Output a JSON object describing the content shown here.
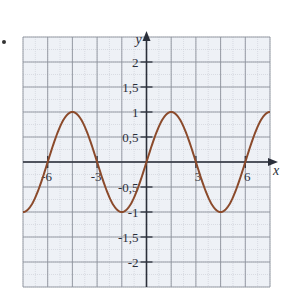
{
  "chart_data": {
    "type": "line",
    "title": "",
    "xlabel": "x",
    "ylabel": "y",
    "xlim": [
      -7.5,
      7.5
    ],
    "ylim": [
      -2.5,
      2.5
    ],
    "grid": true,
    "x_ticks": [
      -6,
      -3,
      3,
      6
    ],
    "x_tick_labels": [
      "-6",
      "-3",
      "3",
      "6"
    ],
    "y_ticks": [
      2,
      1.5,
      1,
      0.5,
      -0.5,
      -1,
      -1.5,
      -2
    ],
    "y_tick_labels": [
      "2",
      "1,5",
      "1",
      "0,5",
      "-0,5",
      "-1",
      "-1,5",
      "-2"
    ],
    "series": [
      {
        "name": "y = sin(πx/3)",
        "color": "#8b4a2b",
        "x": [
          -7.5,
          -6,
          -4.5,
          -3,
          -1.5,
          0,
          1.5,
          3,
          4.5,
          6,
          7.5
        ],
        "y": [
          -1,
          0,
          1,
          0,
          -1,
          0,
          1,
          0,
          -1,
          0,
          1
        ]
      }
    ]
  },
  "colors": {
    "background": "#eef1f6",
    "grid_major": "#8d929c",
    "grid_minor": "#c9cdd5",
    "axis": "#2b2f3a",
    "curve": "#8b4a2b"
  }
}
